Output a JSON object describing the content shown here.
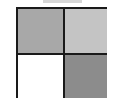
{
  "diagram": {
    "type": "2x2-grid",
    "top_bar": {
      "color": "#d6d6d6"
    },
    "border_color": "#1a1a1a",
    "cells": [
      {
        "position": "top-left",
        "color": "#a8a8a8"
      },
      {
        "position": "top-right",
        "color": "#c4c4c4"
      },
      {
        "position": "bottom-left",
        "color": "#ffffff"
      },
      {
        "position": "bottom-right",
        "color": "#8c8c8c"
      }
    ]
  }
}
